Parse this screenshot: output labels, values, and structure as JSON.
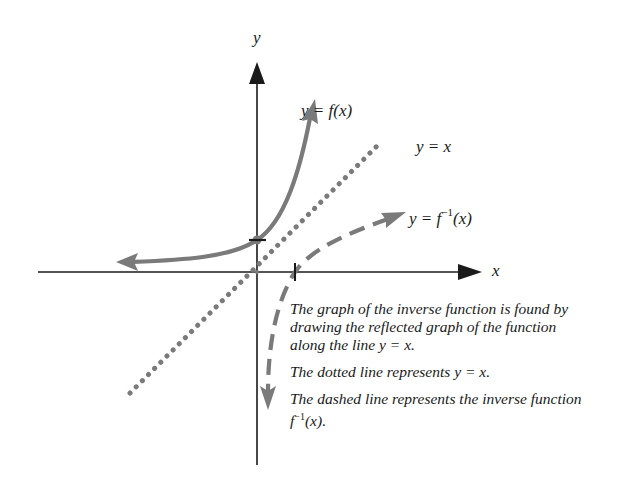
{
  "diagram": {
    "axes": {
      "x_label": "x",
      "y_label": "y"
    },
    "curves": {
      "function_label": "y = f(x)",
      "identity_label": "y = x",
      "inverse_label_prefix": "y = f",
      "inverse_label_sup": "−1",
      "inverse_label_suffix": "(x)"
    },
    "caption": {
      "paragraph_1": "The graph of the inverse function is found by drawing the reflected graph of the function along the line y = x.",
      "paragraph_2": "The dotted line represents y = x.",
      "paragraph_3_prefix": "The dashed line represents the inverse function f",
      "paragraph_3_sup": "−1",
      "paragraph_3_suffix": "(x)."
    },
    "colors": {
      "axis": "#1a1a1a",
      "curve": "#7a7a7a",
      "background": "#ffffff"
    }
  }
}
